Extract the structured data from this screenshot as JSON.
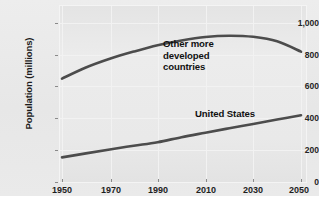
{
  "chart_data": {
    "type": "line",
    "title": "",
    "xlabel": "",
    "ylabel": "Population (millions)",
    "xlim": [
      1950,
      2050
    ],
    "ylim": [
      0,
      1000
    ],
    "grid": true,
    "legend_position": "inline-annotations",
    "x_ticks": [
      "1950",
      "1970",
      "1990",
      "2010",
      "2030",
      "2050"
    ],
    "x_tick_values": [
      1950,
      1970,
      1990,
      2010,
      2030,
      2050
    ],
    "y_ticks": [
      "0",
      "200",
      "400",
      "600",
      "800",
      "1,000"
    ],
    "y_tick_values": [
      0,
      200,
      400,
      600,
      800,
      1000
    ],
    "x": [
      1950,
      1960,
      1970,
      1980,
      1990,
      2000,
      2010,
      2020,
      2030,
      2040,
      2050
    ],
    "series": [
      {
        "name": "Other more developed countries",
        "color": "#4c4c4c",
        "values": [
          650,
          720,
          775,
          820,
          860,
          890,
          912,
          920,
          913,
          885,
          820
        ]
      },
      {
        "name": "United States",
        "color": "#4c4c4c",
        "values": [
          155,
          180,
          205,
          228,
          250,
          282,
          310,
          338,
          365,
          393,
          420
        ]
      }
    ],
    "annotations": [
      {
        "text_lines": [
          "Other more",
          "developed",
          "countries"
        ],
        "near_series": "Other more developed countries"
      },
      {
        "text_lines": [
          "United States"
        ],
        "near_series": "United States"
      }
    ]
  },
  "labels": {
    "y_axis_title": "Population (millions)",
    "series_other_line1": "Other more",
    "series_other_line2": "developed",
    "series_other_line3": "countries",
    "series_us": "United States"
  },
  "colors": {
    "panel_background": "#e9e9e9",
    "plot_background": "#e9e9e9",
    "gridline": "#f2f2f2",
    "line": "#4c4c4c",
    "text": "#1c1c1c"
  }
}
